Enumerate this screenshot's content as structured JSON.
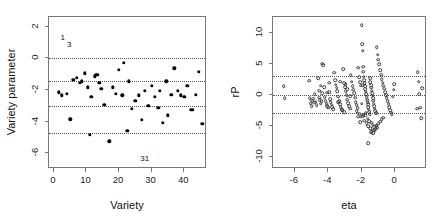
{
  "figure": {
    "width": 439,
    "height": 224,
    "background": "#ffffff",
    "point_color": "#000000",
    "gridline_color": "#555555",
    "axis_color": "#787878"
  },
  "chart_data": [
    {
      "type": "scatter",
      "panel": "left",
      "title": "",
      "xlabel": "Variety",
      "ylabel": "Variety parameter",
      "xlim": [
        -1.5,
        47
      ],
      "ylim": [
        -7.0,
        2.6
      ],
      "xticks": [
        0,
        10,
        20,
        30,
        40
      ],
      "yticks": [
        2,
        0,
        -2,
        -4,
        -6
      ],
      "xticklabels": [
        "0",
        "10",
        "20",
        "30",
        "40"
      ],
      "yticklabels": [
        "2",
        "0",
        "-2",
        "-4",
        "-6"
      ],
      "grid": false,
      "marker": "filled-circle",
      "reference_lines": [
        0.0,
        -1.45,
        -3.0,
        -4.7
      ],
      "annotations": [
        {
          "text": "1",
          "x": 2.0,
          "y": 1.55,
          "style": "superscript-left"
        },
        {
          "text": "3",
          "x": 4.0,
          "y": 1.1,
          "style": "subscript-right"
        },
        {
          "text": "31",
          "x": 26.5,
          "y": -6.1,
          "style": "plain"
        }
      ],
      "x": [
        1.5,
        2.5,
        4.0,
        5.0,
        6.0,
        7.0,
        8.0,
        8.5,
        9.5,
        10.5,
        11.0,
        11.5,
        12.5,
        13.0,
        13.5,
        14.0,
        14.5,
        15.5,
        17.0,
        18.0,
        19.0,
        20.0,
        21.0,
        21.5,
        22.5,
        23.0,
        24.0,
        25.0,
        26.0,
        27.0,
        28.0,
        29.0,
        30.0,
        31.0,
        32.0,
        32.5,
        33.5,
        34.5,
        35.0,
        36.0,
        37.0,
        38.0,
        39.0,
        40.0,
        41.0,
        42.0,
        42.5,
        43.5,
        44.5,
        45.5
      ],
      "y": [
        -2.15,
        -2.35,
        -2.25,
        -3.85,
        -1.35,
        -1.25,
        -1.55,
        -1.45,
        -0.95,
        -1.85,
        -4.85,
        -2.45,
        -1.15,
        -1.05,
        -1.05,
        -1.55,
        -1.95,
        -2.95,
        -5.25,
        -1.85,
        -2.25,
        -0.75,
        -2.35,
        -0.3,
        -4.6,
        -1.45,
        -3.2,
        -2.7,
        -2.35,
        -3.9,
        -2.05,
        -3.0,
        -1.75,
        -2.45,
        -3.15,
        -2.05,
        -4.1,
        -1.45,
        -3.6,
        -2.3,
        -0.65,
        -2.05,
        -2.35,
        -2.45,
        -1.75,
        -3.25,
        -3.25,
        -2.3,
        -0.85,
        -4.15
      ]
    },
    {
      "type": "scatter",
      "panel": "right",
      "title": "",
      "xlabel": "eta",
      "ylabel": "rP",
      "xlim": [
        -7.3,
        1.9
      ],
      "ylim": [
        -12.0,
        12.5
      ],
      "xticks": [
        -6,
        -4,
        -2,
        0
      ],
      "yticks": [
        10,
        5,
        0,
        -5,
        -10
      ],
      "xticklabels": [
        "-6",
        "-4",
        "-2",
        "0"
      ],
      "yticklabels": [
        "10",
        "5",
        "0",
        "-5",
        "-10"
      ],
      "grid": false,
      "marker": "open-circle",
      "reference_lines": [
        3.0,
        0.0,
        -3.0
      ],
      "annotations": [],
      "x": [
        -6.65,
        -6.6,
        -5.15,
        -5.1,
        -5.05,
        -4.95,
        -4.9,
        -4.85,
        -4.8,
        -4.75,
        -4.7,
        -4.6,
        -4.55,
        -4.5,
        -4.45,
        -4.4,
        -4.35,
        -4.3,
        -4.25,
        -4.2,
        -4.15,
        -4.1,
        -4.05,
        -4.0,
        -3.95,
        -3.9,
        -3.85,
        -3.8,
        -3.75,
        -3.7,
        -3.65,
        -3.6,
        -3.55,
        -3.5,
        -3.45,
        -3.4,
        -3.35,
        -3.3,
        -3.25,
        -3.2,
        -3.15,
        -3.1,
        -3.05,
        -3.0,
        -2.95,
        -2.9,
        -2.85,
        -2.8,
        -2.75,
        -2.7,
        -2.65,
        -2.6,
        -2.55,
        -2.5,
        -2.45,
        -2.4,
        -2.35,
        -2.3,
        -2.25,
        -2.2,
        -2.15,
        -2.1,
        -2.05,
        -2.0,
        -1.98,
        -1.95,
        -1.92,
        -1.9,
        -1.88,
        -1.85,
        -1.82,
        -1.8,
        -1.78,
        -1.75,
        -1.72,
        -1.7,
        -1.68,
        -1.65,
        -1.62,
        -1.6,
        -1.58,
        -1.55,
        -1.52,
        -1.5,
        -1.48,
        -1.45,
        -1.42,
        -1.4,
        -1.38,
        -1.35,
        -1.32,
        -1.3,
        -1.28,
        -1.25,
        -1.22,
        -1.2,
        -1.15,
        -1.1,
        -1.05,
        -1.0,
        -0.95,
        -0.9,
        -0.85,
        -0.8,
        -0.75,
        -0.7,
        -0.65,
        -0.6,
        -0.55,
        -0.5,
        -0.45,
        -0.4,
        -0.35,
        -0.3,
        -0.25,
        -0.2,
        -0.15,
        -0.1,
        -0.05,
        1.3,
        1.35,
        1.4,
        1.45,
        1.5,
        1.55,
        1.6,
        -2.0,
        -1.85,
        -1.7,
        -1.6,
        -1.5,
        -1.4,
        -1.3,
        -1.2,
        -1.1,
        -1.0,
        -0.9,
        -0.8,
        -0.7,
        -1.95,
        -1.8,
        -1.65,
        -1.55,
        -1.45,
        -1.35,
        -1.25,
        -1.15,
        -2.1,
        -2.05,
        -1.9,
        -1.75,
        -2.3,
        -2.2,
        -2.15,
        -3.05,
        -2.95,
        -2.85,
        -2.7,
        -3.4,
        -3.3,
        -4.05,
        -3.95,
        -4.55,
        -4.45,
        -4.35,
        -5.0,
        -1.95,
        -1.6,
        -1.45,
        -1.25,
        -1.05
      ],
      "y": [
        1.3,
        -0.55,
        2.2,
        -0.6,
        -1.35,
        -1.0,
        -0.65,
        -1.3,
        0.1,
        -1.15,
        -1.7,
        2.6,
        0.6,
        -0.9,
        -1.5,
        -1.1,
        5.0,
        4.7,
        1.15,
        -0.45,
        -1.05,
        -1.55,
        -1.85,
        -2.1,
        0.35,
        -0.75,
        -1.25,
        -1.65,
        -2.0,
        -2.35,
        3.5,
        2.3,
        1.6,
        1.1,
        0.5,
        -0.35,
        -1.1,
        -1.6,
        -2.0,
        -2.4,
        -2.55,
        4.1,
        1.85,
        1.2,
        0.55,
        -0.15,
        -0.85,
        -1.4,
        -1.9,
        -2.25,
        3.1,
        2.05,
        1.35,
        0.75,
        0.2,
        -0.5,
        -1.2,
        -1.75,
        -2.2,
        4.3,
        2.8,
        1.95,
        1.45,
        11.2,
        8.1,
        7.1,
        4.5,
        3.7,
        2.9,
        2.35,
        1.8,
        1.3,
        0.9,
        0.45,
        0.05,
        -0.4,
        -0.8,
        -1.25,
        -1.6,
        -2.05,
        -2.45,
        -2.8,
        -3.15,
        2.6,
        2.0,
        1.55,
        1.1,
        0.65,
        0.25,
        -0.2,
        -0.6,
        -1.0,
        -1.45,
        -1.85,
        -2.3,
        -2.7,
        -3.05,
        7.6,
        6.4,
        5.6,
        4.9,
        3.9,
        3.2,
        2.5,
        1.9,
        1.4,
        0.95,
        0.4,
        -0.1,
        -0.6,
        -1.1,
        -1.55,
        -2.0,
        -2.5,
        -2.9,
        -3.2,
        -0.35,
        0.75,
        1.7,
        -2.25,
        3.6,
        2.1,
        0.05,
        -2.1,
        -3.85,
        1.05,
        -1.45,
        -4.2,
        -4.6,
        -5.1,
        -5.45,
        -5.9,
        -6.2,
        -5.55,
        -5.05,
        -4.7,
        -4.35,
        -4.0,
        -3.7,
        -3.45,
        -3.3,
        -3.9,
        -4.25,
        -4.55,
        -4.85,
        -5.25,
        -5.0,
        -4.45,
        -3.55,
        -3.25,
        -2.95,
        -2.7,
        -3.6,
        -3.1,
        -2.85,
        1.7,
        0.85,
        -0.25,
        -1.2,
        2.1,
        0.3,
        1.9,
        -0.5,
        1.4,
        0.2,
        -1.9,
        1.55,
        -7.85,
        -6.05,
        -5.75,
        -5.35,
        -4.95
      ]
    }
  ]
}
